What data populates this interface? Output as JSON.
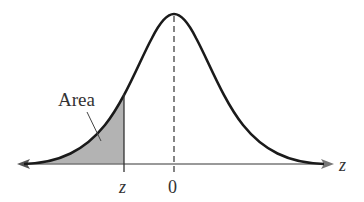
{
  "diagram": {
    "type": "normal-distribution-curve",
    "area_label": "Area",
    "z_label": "z",
    "zero_label": "0",
    "axis_label": "z",
    "colors": {
      "curve": "#1a1a1a",
      "shade": "#b3b3b3",
      "axis": "#777777",
      "text": "#333333"
    }
  }
}
